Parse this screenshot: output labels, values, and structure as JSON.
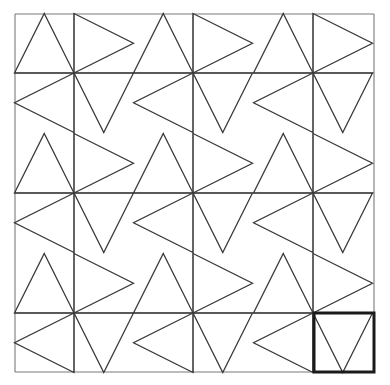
{
  "figure": {
    "caption_cropped": "",
    "colors": {
      "background": "#ffffff",
      "grid_line": "#7a7a7a",
      "triangle_line": "#3a3a3a",
      "highlight_line": "#1a1a1a"
    },
    "grid": {
      "x_lines": [
        15,
        74,
        193,
        313,
        374
      ],
      "y_lines": [
        14,
        73,
        193,
        313,
        372
      ]
    },
    "pinwheel_unit": 59.5,
    "hubs": [
      {
        "x": 74,
        "y": 73
      },
      {
        "x": 193,
        "y": 73
      },
      {
        "x": 313,
        "y": 73
      },
      {
        "x": 74,
        "y": 193
      },
      {
        "x": 193,
        "y": 193
      },
      {
        "x": 313,
        "y": 193
      },
      {
        "x": 74,
        "y": 313
      },
      {
        "x": 193,
        "y": 313
      },
      {
        "x": 313,
        "y": 313
      }
    ],
    "highlight_cell": {
      "x": 314,
      "y": 313,
      "width": 60,
      "height": 59
    }
  }
}
